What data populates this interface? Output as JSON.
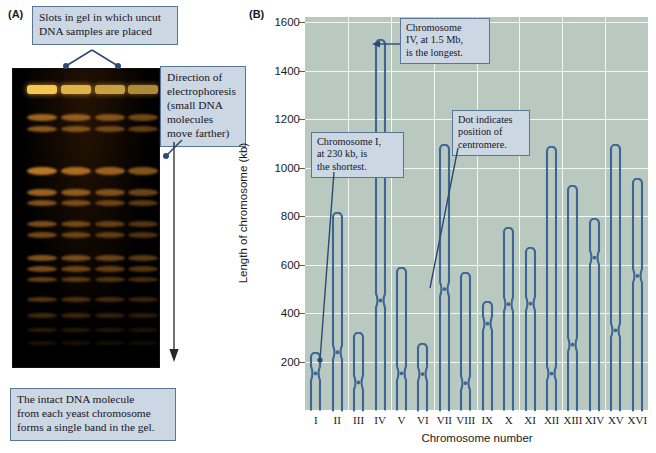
{
  "figure": {
    "panel_a_label": "(A)",
    "panel_b_label": "(B)"
  },
  "panel_a": {
    "callout_slots": "Slots in gel in which uncut\nDNA samples are placed",
    "callout_direction": "Direction of\nelectrophoresis\n(small DNA\nmolecules\nmove farther)",
    "callout_band": "The intact DNA molecule\nfrom each yeast chromosome\nforms a single band in the gel.",
    "lane_count": 4,
    "gel_background": "#000000",
    "band_color": "#d98a2b",
    "slot_color": "#f6c552"
  },
  "panel_b": {
    "callout_shortest": "Chromosome I,\nat 230 kb, is\nthe shortest.",
    "callout_longest": "Chromosome\nIV, at 1.5 Mb,\nis the longest.",
    "callout_centromere": "Dot indicates\nposition of\ncentromere.",
    "plot_background": "#b9c9bf",
    "grid_color": "#f2f6f3",
    "chromosome_color": "#3b6695"
  },
  "chart_data": {
    "type": "bar",
    "title": "",
    "xlabel": "Chromosome number",
    "ylabel": "Length of chromosome (kb)",
    "ylim": [
      0,
      1700
    ],
    "yticks": [
      200,
      400,
      600,
      800,
      1000,
      1200,
      1400,
      1600
    ],
    "grid": true,
    "legend": "none",
    "categories": [
      "I",
      "II",
      "III",
      "IV",
      "V",
      "VI",
      "VII",
      "VIII",
      "IX",
      "X",
      "XI",
      "XII",
      "XIII",
      "XIV",
      "XV",
      "XVI"
    ],
    "values": [
      230,
      810,
      315,
      1520,
      580,
      270,
      1090,
      560,
      440,
      745,
      665,
      1080,
      920,
      785,
      1090,
      950
    ],
    "centromere_kb": [
      150,
      240,
      115,
      450,
      150,
      150,
      500,
      110,
      355,
      435,
      440,
      150,
      270,
      630,
      330,
      555
    ],
    "annotations": [
      {
        "text": "Chromosome I, at 230 kb, is the shortest.",
        "target_category": "I"
      },
      {
        "text": "Chromosome IV, at 1.5 Mb, is the longest.",
        "target_category": "IV"
      },
      {
        "text": "Dot indicates position of centromere.",
        "target_category": "VII"
      }
    ]
  }
}
